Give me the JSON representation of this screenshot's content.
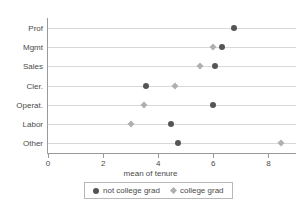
{
  "chart_data": {
    "type": "scatter",
    "title": "",
    "xlabel": "mean of tenure",
    "ylabel": "",
    "xlim": [
      0,
      9
    ],
    "xticks": [
      0,
      2,
      4,
      6,
      8
    ],
    "xtick_labels": [
      "0",
      "2",
      "4",
      "6",
      "8"
    ],
    "grid": true,
    "grid_orientation": "horizontal",
    "legend_position": "bottom",
    "categories": [
      "Prof",
      "Mgmt",
      "Sales",
      "Cler.",
      "Operat.",
      "Labor",
      "Other"
    ],
    "series": [
      {
        "name": "not college grad",
        "marker": "circle",
        "color": "#555555",
        "values": [
          6.75,
          6.3,
          6.05,
          3.55,
          6.0,
          4.45,
          4.7
        ]
      },
      {
        "name": "college grad",
        "marker": "diamond",
        "color": "#b0b0b0",
        "values": [
          null,
          6.0,
          5.5,
          4.6,
          3.5,
          3.0,
          8.45
        ]
      }
    ]
  },
  "axis": {
    "x_label": "mean of tenure",
    "y_label_partial": "e"
  },
  "legend": {
    "entries": [
      {
        "label": "not college grad",
        "marker": "circle",
        "color": "#555555"
      },
      {
        "label": "college grad",
        "marker": "diamond",
        "color": "#b0b0b0"
      }
    ]
  },
  "colors": {
    "not_college_grad": "#555555",
    "college_grad": "#b0b0b0",
    "axis": "#9a9a9a",
    "grid": "#d8d8d8",
    "text": "#4a4a4a",
    "background": "#ffffff"
  }
}
